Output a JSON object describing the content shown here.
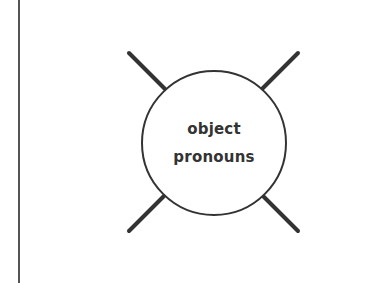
{
  "diagram": {
    "center_label": {
      "line1": "object",
      "line2": "pronouns"
    },
    "colors": {
      "stroke": "#333333",
      "text": "#333333",
      "margin_line": "#555555",
      "background": "#ffffff"
    },
    "spokes": [
      {
        "position": "top-left"
      },
      {
        "position": "top-right"
      },
      {
        "position": "bottom-left"
      },
      {
        "position": "bottom-right"
      }
    ]
  }
}
